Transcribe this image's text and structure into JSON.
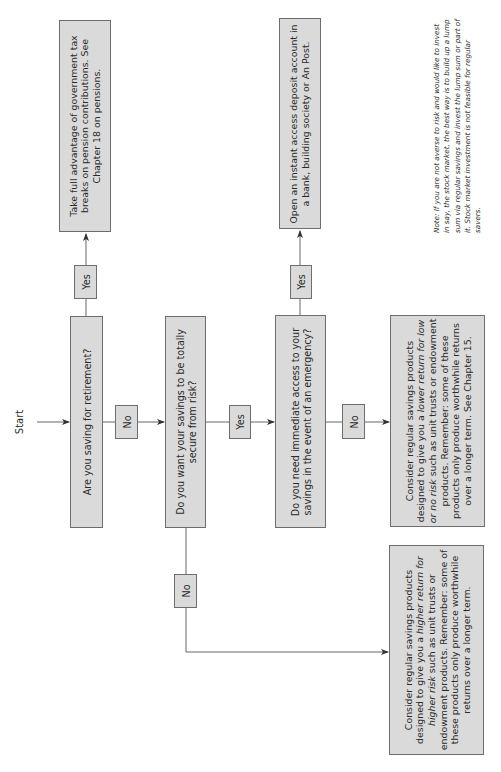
{
  "start_label": "Start",
  "questions": {
    "retirement": "Are you saving for retirement?",
    "secure": "Do you want your savings to be totally secure from risk?",
    "access": "Do you need immediate access to your savings in the event of an emergency?"
  },
  "outcomes": {
    "pension": "Take full advantage of government tax breaks on pension contributions. See Chapter 18 on pensions.",
    "deposit": "Open an instant access deposit account in a bank, building society or An Post.",
    "low_risk": {
      "pre": "Consider regular savings products designed to give you a ",
      "em": "lower return for low or no risk",
      "post": " such as unit trusts or endowment products. Remember: some of these products only produce worthwhile returns over a longer term. See Chapter 15."
    },
    "high_risk": {
      "pre": "Consider regular savings products designed to give you a ",
      "em": "higher return for higher risk",
      "post": " such as unit trusts or endowment products. Remember: some of these products only produce worthwhile returns over a longer term."
    }
  },
  "edge_labels": {
    "q1_yes": "Yes",
    "q1_no": "No",
    "q2_yes": "Yes",
    "q2_no": "No",
    "q3_yes": "Yes",
    "q3_no": "No"
  },
  "note": "Note: If you are not averse to risk and would like to invest in say, the stock market, the best way is to build up a lump sum via regular savings and invest the lump sum or part of it. Stock market investment is not feasible for regular savers.",
  "colors": {
    "box_fill": "#dadada",
    "box_border": "#6e6e6e",
    "line": "#555555"
  }
}
